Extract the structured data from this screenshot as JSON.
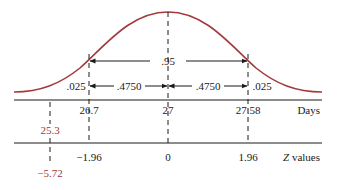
{
  "diagram": {
    "type": "normal-distribution-confidence-interval",
    "colors": {
      "curve": "#a23a3a",
      "annotation_red": "#9b3a3a",
      "ink": "#1a1a1a"
    },
    "areas": {
      "center_total": ".95",
      "left_half": ".4750",
      "right_half": ".4750",
      "left_tail": ".025",
      "right_tail": ".025"
    },
    "days_axis": {
      "label": "Days",
      "ticks": [
        "26.7",
        "27",
        "27.58"
      ],
      "extra_value": "25.3"
    },
    "z_axis": {
      "label_italic": "Z",
      "label_rest": " values",
      "ticks": [
        "−1.96",
        "0",
        "1.96"
      ],
      "extra_value": "−5.72"
    }
  }
}
